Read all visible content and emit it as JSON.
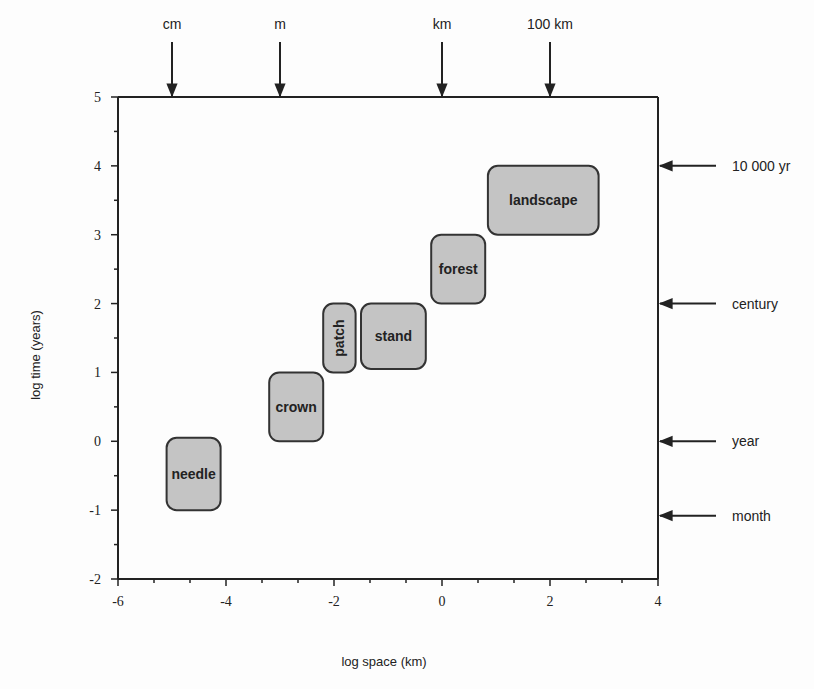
{
  "chart_data": {
    "type": "diagram",
    "title": "",
    "xlabel": "log space (km)",
    "ylabel": "log time (years)",
    "xlim": [
      -6,
      4
    ],
    "ylim": [
      -2,
      5
    ],
    "x_ticks": [
      -6,
      -4,
      -2,
      0,
      2,
      4
    ],
    "y_ticks": [
      -2,
      -1,
      0,
      1,
      2,
      3,
      4,
      5
    ],
    "x_tick_labels": [
      "-6",
      "-4",
      "-2",
      "0",
      "2",
      "4"
    ],
    "y_tick_labels": [
      "-2",
      "-1",
      "0",
      "1",
      "2",
      "3",
      "4",
      "5"
    ],
    "grid": false,
    "boxes": [
      {
        "label": "needle",
        "x0": -5.1,
        "x1": -4.1,
        "y0": -1.0,
        "y1": 0.05,
        "rotated": false
      },
      {
        "label": "crown",
        "x0": -3.2,
        "x1": -2.2,
        "y0": 0.0,
        "y1": 1.0,
        "rotated": false
      },
      {
        "label": "patch",
        "x0": -2.2,
        "x1": -1.6,
        "y0": 1.0,
        "y1": 2.0,
        "rotated": true
      },
      {
        "label": "stand",
        "x0": -1.5,
        "x1": -0.3,
        "y0": 1.05,
        "y1": 2.0,
        "rotated": false
      },
      {
        "label": "forest",
        "x0": -0.2,
        "x1": 0.8,
        "y0": 2.0,
        "y1": 3.0,
        "rotated": false
      },
      {
        "label": "landscape",
        "x0": 0.85,
        "x1": 2.9,
        "y0": 3.0,
        "y1": 4.0,
        "rotated": false
      }
    ],
    "top_markers": [
      {
        "label": "cm",
        "x": -5
      },
      {
        "label": "m",
        "x": -3
      },
      {
        "label": "km",
        "x": 0
      },
      {
        "label": "100 km",
        "x": 2
      }
    ],
    "right_markers": [
      {
        "label": "10 000 yr",
        "y": 4
      },
      {
        "label": "century",
        "y": 2
      },
      {
        "label": "year",
        "y": 0
      },
      {
        "label": "month",
        "y": -1.08
      }
    ]
  },
  "colors": {
    "box_fill": "#c4c4c4",
    "box_stroke": "#333333",
    "axis": "#222222",
    "background": "#fdfdfd"
  }
}
